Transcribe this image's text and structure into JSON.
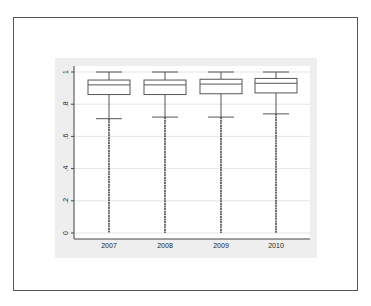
{
  "chart_data": {
    "type": "box",
    "title": "",
    "xlabel": "",
    "ylabel": "",
    "categories": [
      "2007",
      "2008",
      "2009",
      "2010"
    ],
    "ylim": [
      0,
      1
    ],
    "yticks": [
      0,
      0.2,
      0.4,
      0.6,
      0.8,
      1
    ],
    "ytick_labels": [
      "0",
      ".2",
      ".4",
      ".6",
      ".8",
      "1"
    ],
    "grid": true,
    "legend": null,
    "series": [
      {
        "name": "2007",
        "whisker_low": 0.71,
        "q1": 0.86,
        "median": 0.92,
        "q3": 0.95,
        "whisker_high": 1.0,
        "outliers_range": [
          0,
          0.71
        ]
      },
      {
        "name": "2008",
        "whisker_low": 0.72,
        "q1": 0.86,
        "median": 0.92,
        "q3": 0.95,
        "whisker_high": 1.0,
        "outliers_range": [
          0,
          0.72
        ]
      },
      {
        "name": "2009",
        "whisker_low": 0.72,
        "q1": 0.865,
        "median": 0.925,
        "q3": 0.955,
        "whisker_high": 1.0,
        "outliers_range": [
          0,
          0.72
        ]
      },
      {
        "name": "2010",
        "whisker_low": 0.74,
        "q1": 0.87,
        "median": 0.93,
        "q3": 0.96,
        "whisker_high": 1.0,
        "outliers_range": [
          0,
          0.74
        ]
      }
    ]
  },
  "colors": {
    "plot_background": "#eeeeee",
    "inner_background": "#ffffff",
    "box_stroke": "#555555",
    "axis": "#444444",
    "grid": "#dddddd"
  }
}
